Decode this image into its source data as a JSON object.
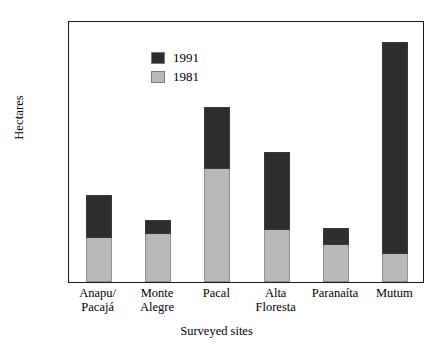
{
  "chart_data": {
    "type": "bar",
    "subtype": "stacked-bar",
    "title": "",
    "xlabel": "Surveyed sites",
    "ylabel": "Hectares",
    "ylim": [
      0,
      9000
    ],
    "ytick_step": 1000,
    "yticks": [
      "9000",
      "8000",
      "7000",
      "6000",
      "5000",
      "4000",
      "3000",
      "2000",
      "1000",
      "0"
    ],
    "grid": false,
    "legend_position": "top-left",
    "categories": [
      "Anapu/\nPacajá",
      "Monte\nAlegre",
      "Pacal",
      "Alta\nFloresta",
      "Paranaíta",
      "Mutum"
    ],
    "category_labels": [
      {
        "line1": "Anapu/",
        "line2": "Pacajá"
      },
      {
        "line1": "Monte",
        "line2": "Alegre"
      },
      {
        "line1": "Pacal",
        "line2": ""
      },
      {
        "line1": "Alta",
        "line2": "Floresta"
      },
      {
        "line1": "Paranaíta",
        "line2": ""
      },
      {
        "line1": "Mutum",
        "line2": ""
      }
    ],
    "series": [
      {
        "name": "1991",
        "color": "#2d2d2d",
        "values": [
          1450,
          430,
          2100,
          2630,
          550,
          7250
        ]
      },
      {
        "name": "1981",
        "color": "#b8b8b8",
        "values": [
          1550,
          1700,
          3900,
          1820,
          1300,
          1000
        ]
      }
    ],
    "stack_order": [
      "1981",
      "1991"
    ],
    "totals": [
      3000,
      2130,
      6000,
      4450,
      1850,
      8250
    ]
  },
  "legend": {
    "entries": [
      {
        "label": "1991",
        "color": "#2d2d2d"
      },
      {
        "label": "1981",
        "color": "#b8b8b8"
      }
    ]
  },
  "colors": {
    "series_1991": "#2d2d2d",
    "series_1981": "#b8b8b8",
    "axis": "#1a1a1a",
    "background": "#ffffff"
  }
}
